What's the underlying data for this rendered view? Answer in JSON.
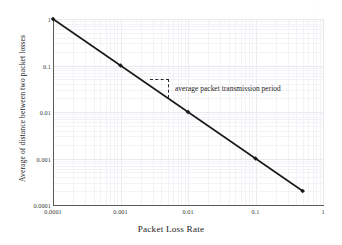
{
  "chart_data": {
    "type": "line",
    "title": "",
    "xlabel": "Packet Loss Rate",
    "ylabel": "Average of distance between two packet losses",
    "xscale": "log",
    "yscale": "log",
    "xlim": [
      0.0001,
      1
    ],
    "ylim": [
      0.0001,
      1
    ],
    "grid": true,
    "legend": "none",
    "xticks": [
      "0.0001",
      "0.001",
      "0.01",
      "0.1",
      "1"
    ],
    "xtick_values": [
      0.0001,
      0.001,
      0.01,
      0.1,
      1
    ],
    "yticks": [
      "0.0001",
      "0.001",
      "0.01",
      "0.1",
      "1"
    ],
    "ytick_values": [
      0.0001,
      0.001,
      0.01,
      0.1,
      1
    ],
    "series": [
      {
        "name": "average distance between two packet losses",
        "marker": "diamond",
        "color": "#1a1a1a",
        "x": [
          0.0001,
          0.001,
          0.01,
          0.1,
          0.5
        ],
        "y": [
          1,
          0.1,
          0.01,
          0.001,
          0.0002
        ]
      }
    ],
    "annotations": [
      {
        "text": "average packet transmission period",
        "style": "dashed-bracket",
        "x_start": 0.0022,
        "x_end": 0.0055,
        "y_top": 0.045,
        "y_bottom": 0.018
      }
    ]
  },
  "axes": {
    "x_title": "Packet Loss Rate",
    "y_title": "Average of distance between two packet losses"
  },
  "annotation": {
    "label": "average packet transmission period"
  },
  "ticks": {
    "x": [
      "0.0001",
      "0.001",
      "0.01",
      "0.1",
      "1"
    ],
    "y": [
      "1",
      "0.1",
      "0.01",
      "0.001",
      "0.0001"
    ]
  }
}
